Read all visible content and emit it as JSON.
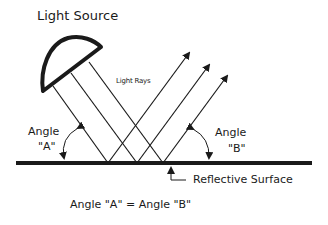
{
  "diagram": {
    "title": "Light Source",
    "rays_label": "Light Rays",
    "angle_a": {
      "line1": "Angle",
      "line2": "\"A\""
    },
    "angle_b": {
      "line1": "Angle",
      "line2": "\"B\""
    },
    "surface_label": "Reflective Surface",
    "equation": "Angle \"A\" = Angle \"B\""
  },
  "colors": {
    "ink": "#1a1a1a",
    "background": "#ffffff"
  },
  "icons": {
    "lamp": "lamp-icon",
    "arrowhead": "arrowhead-icon"
  }
}
